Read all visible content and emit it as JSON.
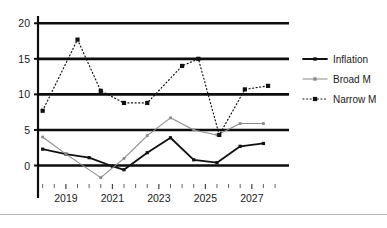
{
  "chart_data": {
    "type": "line",
    "title": "",
    "xlabel": "",
    "ylabel": "",
    "xlim": [
      2017.8,
      2028.6
    ],
    "ylim": [
      -2.6,
      20.6
    ],
    "grid": true,
    "gridlines_y": [
      0,
      5,
      10,
      15,
      20
    ],
    "legend_position": "right",
    "y_ticks": [
      "0",
      "5",
      "10",
      "15",
      "20"
    ],
    "y_tick_values": [
      0,
      5,
      10,
      15,
      20
    ],
    "x_ticks": [
      "2019",
      "2021",
      "2023",
      "2025",
      "2027"
    ],
    "x_tick_values": [
      2019,
      2021,
      2023,
      2025,
      2027
    ],
    "x_minor_ticks": [
      2018,
      2018.5,
      2019.5,
      2020,
      2020.5,
      2021.5,
      2022,
      2022.5,
      2023.5,
      2024,
      2024.5,
      2025.5,
      2026,
      2026.5,
      2027.5,
      2028
    ],
    "series": [
      {
        "name": "Inflation",
        "style": "solid-thick",
        "color": "#101010",
        "marker": "square",
        "x": [
          2018.0,
          2019.0,
          2020.0,
          2021.0,
          2021.5,
          2022.5,
          2023.5,
          2024.5,
          2025.5,
          2026.5,
          2027.5
        ],
        "values": [
          2.3,
          1.6,
          1.1,
          -0.1,
          -0.6,
          1.8,
          3.9,
          0.8,
          0.4,
          2.7,
          3.1
        ]
      },
      {
        "name": "Broad M",
        "style": "solid-thin",
        "color": "#8a8a8a",
        "marker": "square",
        "x": [
          2018.0,
          2019.0,
          2020.5,
          2021.5,
          2022.5,
          2023.5,
          2024.5,
          2025.5,
          2026.5,
          2027.5
        ],
        "values": [
          4.0,
          1.6,
          -1.7,
          1.0,
          4.2,
          6.7,
          5.0,
          4.3,
          5.9,
          5.9
        ]
      },
      {
        "name": "Narrow M",
        "style": "dotted",
        "color": "#101010",
        "marker": "square",
        "x": [
          2018.0,
          2019.5,
          2020.5,
          2021.5,
          2022.5,
          2024.0,
          2024.7,
          2025.6,
          2026.7,
          2027.7
        ],
        "values": [
          7.7,
          17.7,
          10.5,
          8.8,
          8.8,
          14.0,
          15.0,
          4.3,
          10.7,
          11.2
        ]
      }
    ],
    "legend": [
      {
        "label": "Inflation",
        "style": "solid-thick",
        "color": "#101010"
      },
      {
        "label": "Broad M",
        "style": "solid-thin",
        "color": "#8a8a8a"
      },
      {
        "label": "Narrow M",
        "style": "dotted",
        "color": "#101010"
      }
    ]
  }
}
